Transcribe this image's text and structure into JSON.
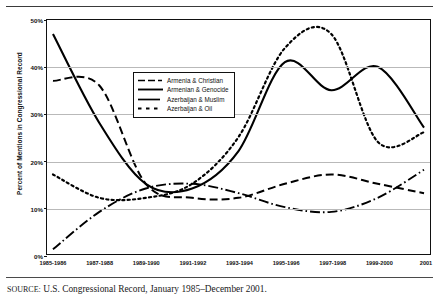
{
  "figure": {
    "cut_off_caption_above": "",
    "source_prefix": "SOURCE:",
    "source_text": " U.S. Congressional Record, January 1985–December 2001."
  },
  "chart_data": {
    "type": "line",
    "title": "",
    "xlabel": "",
    "ylabel": "Percent of Mentions in Congressional Record",
    "ylim": [
      0,
      50
    ],
    "yticks": [
      0,
      10,
      20,
      30,
      40,
      50
    ],
    "ytick_labels": [
      "0%",
      "10%",
      "20%",
      "30%",
      "40%",
      "50%"
    ],
    "grid": true,
    "legend_position": "upper-left-inside",
    "categories": [
      "1985-1986",
      "1987-1988",
      "1989-1990",
      "1991-1992",
      "1993-1994",
      "1995-1996",
      "1997-1998",
      "1999-2000",
      "2001"
    ],
    "series": [
      {
        "name": "Armenia & Christian",
        "style": "dashed",
        "values": [
          37,
          36,
          15,
          12,
          12,
          15,
          17,
          15,
          13
        ]
      },
      {
        "name": "Armenian & Genocide",
        "style": "solid",
        "values": [
          47,
          28,
          15,
          14,
          22,
          41,
          35,
          40,
          27
        ]
      },
      {
        "name": "Azerbaijan & Muslim",
        "style": "dash-dot",
        "values": [
          1,
          9,
          14,
          15,
          13,
          10,
          9,
          12,
          18
        ]
      },
      {
        "name": "Azerbaijan & Oil",
        "style": "dotted",
        "values": [
          17,
          12,
          12,
          15,
          25,
          44,
          47,
          24,
          26
        ]
      }
    ]
  },
  "legend": {
    "items": [
      {
        "label": "Armenia & Christian",
        "style": "dashed"
      },
      {
        "label": "Armenian & Genocide",
        "style": "solid"
      },
      {
        "label": "Azerbaijan & Muslim",
        "style": "dash-dot"
      },
      {
        "label": "Azerbaijan & Oil",
        "style": "dotted"
      }
    ]
  }
}
